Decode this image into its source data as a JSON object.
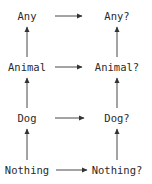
{
  "diagram": {
    "left_column": [
      "Any",
      "Animal",
      "Dog",
      "Nothing"
    ],
    "right_column": [
      "Any?",
      "Animal?",
      "Dog?",
      "Nothing?"
    ],
    "nodes": [
      {
        "id": "any",
        "label": "Any",
        "x": 27,
        "y": 16
      },
      {
        "id": "animal",
        "label": "Animal",
        "x": 27,
        "y": 67
      },
      {
        "id": "dog",
        "label": "Dog",
        "x": 27,
        "y": 118
      },
      {
        "id": "nothing",
        "label": "Nothing",
        "x": 27,
        "y": 170
      },
      {
        "id": "any-nullable",
        "label": "Any?",
        "x": 117,
        "y": 16
      },
      {
        "id": "animal-nullable",
        "label": "Animal?",
        "x": 117,
        "y": 67
      },
      {
        "id": "dog-nullable",
        "label": "Dog?",
        "x": 117,
        "y": 118
      },
      {
        "id": "nothing-nullable",
        "label": "Nothing?",
        "x": 117,
        "y": 170
      }
    ],
    "edges": [
      {
        "from": "Any",
        "to": "Any?",
        "direction": "right"
      },
      {
        "from": "Animal",
        "to": "Animal?",
        "direction": "right"
      },
      {
        "from": "Dog",
        "to": "Dog?",
        "direction": "right"
      },
      {
        "from": "Nothing",
        "to": "Nothing?",
        "direction": "right"
      },
      {
        "from": "Animal",
        "to": "Any",
        "direction": "up"
      },
      {
        "from": "Dog",
        "to": "Animal",
        "direction": "up"
      },
      {
        "from": "Nothing",
        "to": "Dog",
        "direction": "up"
      },
      {
        "from": "Animal?",
        "to": "Any?",
        "direction": "up"
      },
      {
        "from": "Dog?",
        "to": "Animal?",
        "direction": "up"
      },
      {
        "from": "Nothing?",
        "to": "Dog?",
        "direction": "up"
      }
    ],
    "colors": {
      "text": "#2a2a2a",
      "arrow": "#333333",
      "background": "#ffffff"
    }
  }
}
